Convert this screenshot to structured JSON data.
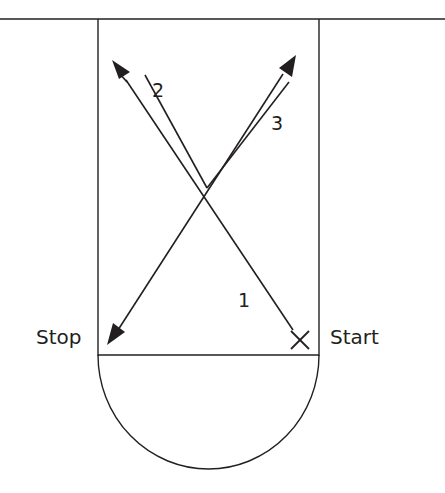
{
  "diagram": {
    "type": "drill-path",
    "stroke_color": "#231f20",
    "labels": {
      "stop": "Stop",
      "start": "Start",
      "start_marker": "X",
      "segment_1": "1",
      "segment_2": "2",
      "segment_3": "3"
    },
    "elements": [
      "baseline (top line)",
      "rectangle lane",
      "semicircle at bottom",
      "path 1: Start to Stop diagonal",
      "path 2: single-to-double line arrow toward top-left",
      "path 3: double line arrow toward top-right"
    ]
  }
}
